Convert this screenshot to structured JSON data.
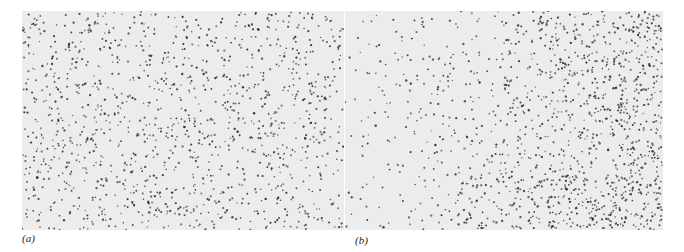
{
  "figure": {
    "panels": [
      {
        "id": "a",
        "label": "(a)",
        "description": "Point pattern with roughly uniform density across the field",
        "pattern": "uniform",
        "dot_color": "#2a2a2a",
        "background_color": "#ececec"
      },
      {
        "id": "b",
        "label": "(b)",
        "description": "Point pattern sparse on the left, dense on the right side",
        "pattern": "gradient-right-dense",
        "dot_color": "#2a2a2a",
        "background_color": "#ececec"
      }
    ]
  }
}
